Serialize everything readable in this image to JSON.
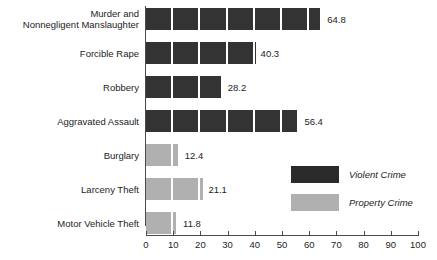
{
  "chart_data": {
    "type": "bar",
    "orientation": "horizontal",
    "title": "",
    "xlabel": "",
    "ylabel": "",
    "xlim": [
      0,
      100
    ],
    "xticks": [
      0,
      10,
      20,
      30,
      40,
      50,
      60,
      70,
      80,
      90,
      100
    ],
    "grid": false,
    "segment_step": 10,
    "legend_position": "center-right",
    "categories": [
      "Murder and Nonnegligent Manslaughter",
      "Forcible Rape",
      "Robbery",
      "Aggravated Assault",
      "Burglary",
      "Larceny Theft",
      "Motor Vehicle Theft"
    ],
    "values": [
      64.8,
      40.3,
      28.2,
      56.4,
      12.4,
      21.1,
      11.8
    ],
    "groups": [
      "Violent Crime",
      "Violent Crime",
      "Violent Crime",
      "Violent Crime",
      "Property Crime",
      "Property Crime",
      "Property Crime"
    ],
    "legend": [
      {
        "label": "Violent Crime",
        "color": "#2b2b2b"
      },
      {
        "label": "Property Crime",
        "color": "#b0b0b0"
      }
    ],
    "colors": {
      "violent": "#333333",
      "property": "#b0b0b0"
    }
  },
  "rows": [
    {
      "label_line1": "Murder and",
      "label_line2": "Nonnegligent Manslaughter",
      "value": 64.8,
      "value_text": "64.8",
      "group": "violent"
    },
    {
      "label_line1": "Forcible Rape",
      "label_line2": "",
      "value": 40.3,
      "value_text": "40.3",
      "group": "violent"
    },
    {
      "label_line1": "Robbery",
      "label_line2": "",
      "value": 28.2,
      "value_text": "28.2",
      "group": "violent"
    },
    {
      "label_line1": "Aggravated Assault",
      "label_line2": "",
      "value": 56.4,
      "value_text": "56.4",
      "group": "violent"
    },
    {
      "label_line1": "Burglary",
      "label_line2": "",
      "value": 12.4,
      "value_text": "12.4",
      "group": "property"
    },
    {
      "label_line1": "Larceny Theft",
      "label_line2": "",
      "value": 21.1,
      "value_text": "21.1",
      "group": "property"
    },
    {
      "label_line1": "Motor Vehicle Theft",
      "label_line2": "",
      "value": 11.8,
      "value_text": "11.8",
      "group": "property"
    }
  ],
  "axis": {
    "ticks": [
      "0",
      "10",
      "20",
      "30",
      "40",
      "50",
      "60",
      "70",
      "80",
      "90",
      "100"
    ]
  },
  "legend": {
    "items": [
      {
        "label": "Violent Crime",
        "group": "violent"
      },
      {
        "label": "Property Crime",
        "group": "property"
      }
    ]
  }
}
